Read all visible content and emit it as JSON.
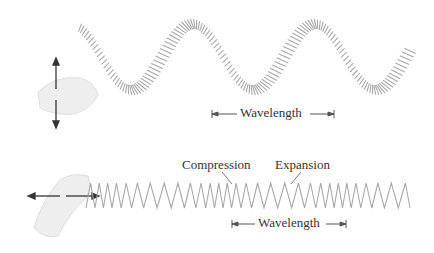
{
  "diagram": {
    "transverse": {
      "label": "Wavelength",
      "motion": "up-down"
    },
    "longitudinal": {
      "labels": {
        "compression": "Compression",
        "expansion": "Expansion",
        "wavelength": "Wavelength"
      },
      "motion": "left-right"
    },
    "colors": {
      "spring": "#a8a8a8",
      "arrow": "#333333",
      "text": "#333333",
      "hand": "#e6e6e6"
    }
  }
}
